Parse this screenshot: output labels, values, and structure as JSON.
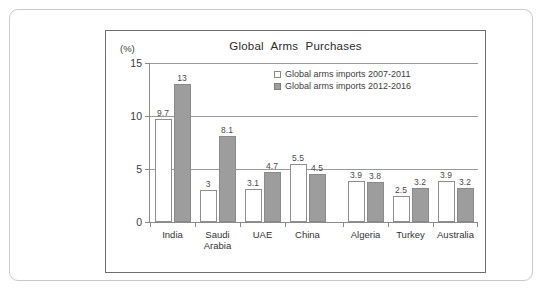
{
  "chart_data": {
    "type": "bar",
    "title": "Global Arms Purchases",
    "unit_label": "(%)",
    "xlabel": "",
    "ylabel": "",
    "ylim": [
      0,
      15
    ],
    "yticks": [
      0,
      5,
      10,
      15
    ],
    "grid": true,
    "legend_position": "top-center",
    "categories": [
      "India",
      "Saudi Arabia",
      "UAE",
      "China",
      "Algeria",
      "Turkey",
      "Australia"
    ],
    "category_lines": [
      [
        "India"
      ],
      [
        "Saudi",
        "Arabia"
      ],
      [
        "UAE"
      ],
      [
        "China"
      ],
      [
        "Algeria"
      ],
      [
        "Turkey"
      ],
      [
        "Australia"
      ]
    ],
    "series": [
      {
        "name": "Global arms imports 2007-2011",
        "values": [
          9.7,
          3,
          3.1,
          5.5,
          3.9,
          2.5,
          3.9
        ],
        "labels": [
          "9.7",
          "3",
          "3.1",
          "5.5",
          "3.9",
          "2.5",
          "3.9"
        ],
        "color": "#ffffff",
        "border": "#8f8f8f"
      },
      {
        "name": "Global arms imports 2012-2016",
        "values": [
          13,
          8.1,
          4.7,
          4.5,
          3.8,
          3.2,
          3.2
        ],
        "labels": [
          "13",
          "8.1",
          "4.7",
          "4.5",
          "3.8",
          "3.2",
          "3.2"
        ],
        "color": "#9d9d9d",
        "border": "#8a8a8a"
      }
    ],
    "group_gap_after_index": 3
  },
  "ytick_labels": [
    "15",
    "10",
    "5",
    "0"
  ],
  "colors": {
    "series_a_fill": "#ffffff",
    "series_b_fill": "#9d9d9d",
    "axis": "#8a8a8a",
    "grid": "#9a9a9a",
    "frame": "#6e6e6e",
    "outer_frame": "#c9c9c9",
    "text": "#333333"
  }
}
